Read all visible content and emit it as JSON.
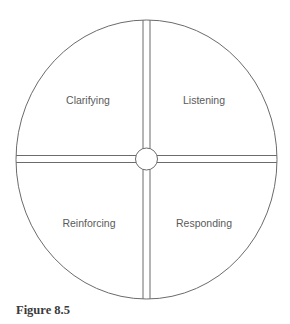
{
  "diagram": {
    "type": "circle-divided-into-quadrants",
    "quadrants": [
      {
        "position": "top-left",
        "label": "Clarifying"
      },
      {
        "position": "top-right",
        "label": "Listening"
      },
      {
        "position": "bottom-left",
        "label": "Reinforcing"
      },
      {
        "position": "bottom-right",
        "label": "Responding"
      }
    ],
    "colors": {
      "stroke": "#6b6b6b",
      "label": "#5a5a5a",
      "background": "#ffffff"
    }
  },
  "caption": "Figure 8.5"
}
